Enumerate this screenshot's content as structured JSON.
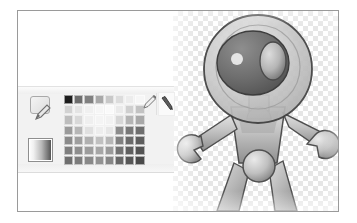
{
  "figure": {
    "frame_border_color": "#9a9a9a",
    "background_color": "#ffffff"
  },
  "workspace": {
    "name": "drawing-workspace",
    "background_color": "#ffffff"
  },
  "canvas": {
    "name": "transparent-canvas",
    "transparency_pattern": "checkerboard",
    "checker_light": "#ffffff",
    "checker_dark": "#e6e6e6",
    "checker_size_px": 5
  },
  "palette_panel": {
    "name": "color-palette-panel",
    "background_color": "#f2f2f2",
    "tools": [
      {
        "name": "shape-pencil-tool",
        "icon": "square-pencil-icon",
        "label": ""
      },
      {
        "name": "foreground-background-swatch",
        "icon": "gradient-swatch-icon",
        "label": ""
      },
      {
        "name": "pen-tool-a",
        "icon": "pencil-icon",
        "label": ""
      },
      {
        "name": "pen-tool-b",
        "icon": "pen-icon",
        "label": ""
      }
    ],
    "swatch_grid": {
      "columns": 8,
      "rows": 7,
      "colors": [
        [
          "#1c1c1c",
          "#6d6d6d",
          "#808080",
          "#a8a8a8",
          "#c8c8c8",
          "#dcdcdc",
          "#ececec",
          "#f6f6f6"
        ],
        [
          "#d2d2d2",
          "#e4e4e4",
          "#f0f0f0",
          "#f6f6f6",
          "#fafafa",
          "#eaeaea",
          "#cfcfcf",
          "#c2c2c2"
        ],
        [
          "#bdbdbd",
          "#d8d8d8",
          "#efefef",
          "#f4f4f4",
          "#f2f2f2",
          "#d6d6d6",
          "#b4b4b4",
          "#a8a8a8"
        ],
        [
          "#9a9a9a",
          "#b6b6b6",
          "#e0e0e0",
          "#ededed",
          "#e6e6e6",
          "#8c8c8c",
          "#777777",
          "#6e6e6e"
        ],
        [
          "#8a8a8a",
          "#9e9e9e",
          "#b0b0b0",
          "#c0c0c0",
          "#b6b6b6",
          "#808080",
          "#6a6a6a",
          "#5e5e5e"
        ],
        [
          "#7e7e7e",
          "#8e8e8e",
          "#9c9c9c",
          "#a6a6a6",
          "#9a9a9a",
          "#727272",
          "#5f5f5f",
          "#545454"
        ],
        [
          "#6e6e6e",
          "#7c7c7c",
          "#888888",
          "#929292",
          "#868686",
          "#666666",
          "#565656",
          "#4a4a4a"
        ]
      ]
    }
  },
  "sprite": {
    "name": "robot-astronaut-sprite",
    "description": "Grayscale robot wearing a round glass helmet, with jointed arms ending in claw hands and two legs joined at a spherical hip",
    "parts": [
      "helmet-dome",
      "head",
      "eye-left",
      "eye-right",
      "neck",
      "torso",
      "arm-left",
      "arm-right",
      "claw-hand-left",
      "claw-hand-right",
      "hip-sphere",
      "leg-left",
      "leg-right"
    ],
    "palette": {
      "outline": "#4a4a4a",
      "helmet_glass": "#c9c9c9",
      "head_dark": "#6e6e6e",
      "body_mid": "#b4b4b4",
      "body_light": "#d8d8d8",
      "body_shadow": "#8f8f8f",
      "highlight": "#f2f2f2"
    }
  }
}
